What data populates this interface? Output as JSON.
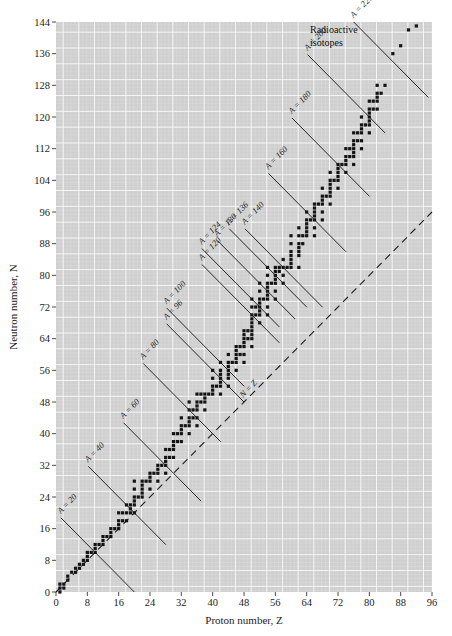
{
  "figure": {
    "background_color": "#ffffff",
    "plot_background_color": "#cfcfcf",
    "grid_minor_color": "#dedede",
    "grid_major_color": "#ffffff",
    "point_color": "#141414",
    "line_color": "#1d1d1d"
  },
  "axes": {
    "x_title": "Proton number, Z",
    "y_title": "Neutron number, N",
    "x_ticks": [
      0,
      8,
      16,
      24,
      32,
      40,
      48,
      56,
      64,
      72,
      80,
      88,
      96
    ],
    "y_ticks": [
      0,
      8,
      16,
      24,
      32,
      40,
      48,
      56,
      64,
      72,
      80,
      88,
      96,
      104,
      112,
      120,
      128,
      136,
      144
    ],
    "xlim": [
      0,
      96
    ],
    "ylim": [
      0,
      144
    ],
    "grid_minor_step": 1,
    "grid_major_step": 4
  },
  "callouts": {
    "radioactive": "Radioactive\nisotopes",
    "radioactive_line1": "Radioactive",
    "radioactive_line2": "isotopes",
    "nz_line": "N = Z"
  },
  "chart_data": {
    "type": "scatter",
    "title": "",
    "xlabel": "Proton number, Z",
    "ylabel": "Neutron number, N",
    "xlim": [
      0,
      96
    ],
    "ylim": [
      0,
      144
    ],
    "grid": true,
    "legend": "none",
    "annotations": [
      {
        "text": "A = 20",
        "A": 20,
        "label_x": 4,
        "label_y": 18
      },
      {
        "text": "A = 40",
        "A": 40,
        "label_x": 11,
        "label_y": 32
      },
      {
        "text": "A = 60",
        "A": 60,
        "label_x": 20,
        "label_y": 42
      },
      {
        "text": "A = 80",
        "A": 80,
        "label_x": 25,
        "label_y": 57
      },
      {
        "text": "A = 96",
        "A": 96,
        "label_x": 31,
        "label_y": 62
      },
      {
        "text": "A = 100",
        "A": 100,
        "label_x": 31,
        "label_y": 68
      },
      {
        "text": "A = 120",
        "A": 120,
        "label_x": 40,
        "label_y": 79
      },
      {
        "text": "A = 124",
        "A": 124,
        "label_x": 40,
        "label_y": 85
      },
      {
        "text": "A = 130",
        "A": 130,
        "label_x": 44,
        "label_y": 88
      },
      {
        "text": "A = 136",
        "A": 136,
        "label_x": 47,
        "label_y": 91
      },
      {
        "text": "A = 140",
        "A": 140,
        "label_x": 51,
        "label_y": 92
      },
      {
        "text": "A = 160",
        "A": 160,
        "label_x": 57,
        "label_y": 104
      },
      {
        "text": "A = 180",
        "A": 180,
        "label_x": 63,
        "label_y": 118
      },
      {
        "text": "A = 200",
        "A": 200,
        "label_x": 67,
        "label_y": 133
      },
      {
        "text": "A = 220",
        "A": 220,
        "label_x": 78,
        "label_y": 140
      }
    ],
    "reference_lines": [
      {
        "name": "N = Z",
        "style": "dashed",
        "from": [
          0,
          0
        ],
        "to": [
          96,
          96
        ]
      }
    ],
    "series": [
      {
        "name": "Stable and long-lived nuclides",
        "marker": "square",
        "points": [
          [
            1,
            0
          ],
          [
            1,
            1
          ],
          [
            1,
            2
          ],
          [
            2,
            1
          ],
          [
            2,
            2
          ],
          [
            3,
            3
          ],
          [
            3,
            4
          ],
          [
            4,
            5
          ],
          [
            5,
            5
          ],
          [
            5,
            6
          ],
          [
            6,
            6
          ],
          [
            6,
            7
          ],
          [
            7,
            7
          ],
          [
            7,
            8
          ],
          [
            8,
            8
          ],
          [
            8,
            9
          ],
          [
            8,
            10
          ],
          [
            9,
            10
          ],
          [
            10,
            10
          ],
          [
            10,
            11
          ],
          [
            10,
            12
          ],
          [
            11,
            12
          ],
          [
            12,
            12
          ],
          [
            12,
            13
          ],
          [
            12,
            14
          ],
          [
            13,
            14
          ],
          [
            14,
            14
          ],
          [
            14,
            15
          ],
          [
            14,
            16
          ],
          [
            15,
            16
          ],
          [
            16,
            16
          ],
          [
            16,
            17
          ],
          [
            16,
            18
          ],
          [
            16,
            20
          ],
          [
            17,
            18
          ],
          [
            17,
            20
          ],
          [
            18,
            18
          ],
          [
            18,
            20
          ],
          [
            18,
            22
          ],
          [
            19,
            20
          ],
          [
            19,
            21
          ],
          [
            19,
            22
          ],
          [
            20,
            20
          ],
          [
            20,
            22
          ],
          [
            20,
            23
          ],
          [
            20,
            24
          ],
          [
            20,
            26
          ],
          [
            20,
            28
          ],
          [
            21,
            24
          ],
          [
            22,
            24
          ],
          [
            22,
            25
          ],
          [
            22,
            26
          ],
          [
            22,
            27
          ],
          [
            22,
            28
          ],
          [
            23,
            28
          ],
          [
            24,
            26
          ],
          [
            24,
            28
          ],
          [
            24,
            29
          ],
          [
            24,
            30
          ],
          [
            25,
            30
          ],
          [
            26,
            28
          ],
          [
            26,
            30
          ],
          [
            26,
            31
          ],
          [
            26,
            32
          ],
          [
            27,
            32
          ],
          [
            28,
            30
          ],
          [
            28,
            32
          ],
          [
            28,
            33
          ],
          [
            28,
            34
          ],
          [
            28,
            36
          ],
          [
            29,
            34
          ],
          [
            29,
            36
          ],
          [
            30,
            34
          ],
          [
            30,
            36
          ],
          [
            30,
            37
          ],
          [
            30,
            38
          ],
          [
            30,
            40
          ],
          [
            31,
            38
          ],
          [
            31,
            40
          ],
          [
            32,
            38
          ],
          [
            32,
            40
          ],
          [
            32,
            41
          ],
          [
            32,
            42
          ],
          [
            32,
            44
          ],
          [
            33,
            42
          ],
          [
            34,
            40
          ],
          [
            34,
            42
          ],
          [
            34,
            43
          ],
          [
            34,
            44
          ],
          [
            34,
            46
          ],
          [
            34,
            48
          ],
          [
            35,
            44
          ],
          [
            35,
            46
          ],
          [
            36,
            42
          ],
          [
            36,
            44
          ],
          [
            36,
            46
          ],
          [
            36,
            47
          ],
          [
            36,
            48
          ],
          [
            36,
            50
          ],
          [
            37,
            48
          ],
          [
            37,
            50
          ],
          [
            38,
            46
          ],
          [
            38,
            48
          ],
          [
            38,
            49
          ],
          [
            38,
            50
          ],
          [
            39,
            50
          ],
          [
            40,
            50
          ],
          [
            40,
            51
          ],
          [
            40,
            52
          ],
          [
            40,
            54
          ],
          [
            40,
            56
          ],
          [
            41,
            52
          ],
          [
            42,
            50
          ],
          [
            42,
            52
          ],
          [
            42,
            53
          ],
          [
            42,
            54
          ],
          [
            42,
            55
          ],
          [
            42,
            56
          ],
          [
            42,
            58
          ],
          [
            44,
            52
          ],
          [
            44,
            54
          ],
          [
            44,
            55
          ],
          [
            44,
            56
          ],
          [
            44,
            57
          ],
          [
            44,
            58
          ],
          [
            44,
            60
          ],
          [
            45,
            58
          ],
          [
            46,
            56
          ],
          [
            46,
            58
          ],
          [
            46,
            59
          ],
          [
            46,
            60
          ],
          [
            46,
            61
          ],
          [
            46,
            62
          ],
          [
            47,
            60
          ],
          [
            47,
            62
          ],
          [
            48,
            58
          ],
          [
            48,
            60
          ],
          [
            48,
            62
          ],
          [
            48,
            63
          ],
          [
            48,
            64
          ],
          [
            48,
            65
          ],
          [
            48,
            66
          ],
          [
            49,
            64
          ],
          [
            49,
            66
          ],
          [
            50,
            62
          ],
          [
            50,
            64
          ],
          [
            50,
            65
          ],
          [
            50,
            66
          ],
          [
            50,
            67
          ],
          [
            50,
            68
          ],
          [
            50,
            69
          ],
          [
            50,
            70
          ],
          [
            50,
            72
          ],
          [
            50,
            74
          ],
          [
            51,
            70
          ],
          [
            51,
            72
          ],
          [
            52,
            68
          ],
          [
            52,
            70
          ],
          [
            52,
            71
          ],
          [
            52,
            72
          ],
          [
            52,
            73
          ],
          [
            52,
            74
          ],
          [
            52,
            76
          ],
          [
            52,
            78
          ],
          [
            53,
            74
          ],
          [
            54,
            70
          ],
          [
            54,
            72
          ],
          [
            54,
            74
          ],
          [
            54,
            75
          ],
          [
            54,
            76
          ],
          [
            54,
            77
          ],
          [
            54,
            78
          ],
          [
            54,
            80
          ],
          [
            54,
            82
          ],
          [
            55,
            78
          ],
          [
            56,
            74
          ],
          [
            56,
            76
          ],
          [
            56,
            78
          ],
          [
            56,
            79
          ],
          [
            56,
            80
          ],
          [
            56,
            81
          ],
          [
            56,
            82
          ],
          [
            57,
            81
          ],
          [
            57,
            82
          ],
          [
            58,
            78
          ],
          [
            58,
            80
          ],
          [
            58,
            82
          ],
          [
            58,
            84
          ],
          [
            59,
            82
          ],
          [
            60,
            82
          ],
          [
            60,
            83
          ],
          [
            60,
            84
          ],
          [
            60,
            85
          ],
          [
            60,
            86
          ],
          [
            60,
            88
          ],
          [
            60,
            90
          ],
          [
            62,
            82
          ],
          [
            62,
            85
          ],
          [
            62,
            86
          ],
          [
            62,
            87
          ],
          [
            62,
            88
          ],
          [
            62,
            90
          ],
          [
            62,
            92
          ],
          [
            63,
            88
          ],
          [
            63,
            90
          ],
          [
            64,
            90
          ],
          [
            64,
            91
          ],
          [
            64,
            92
          ],
          [
            64,
            93
          ],
          [
            64,
            94
          ],
          [
            64,
            96
          ],
          [
            65,
            94
          ],
          [
            66,
            90
          ],
          [
            66,
            92
          ],
          [
            66,
            94
          ],
          [
            66,
            95
          ],
          [
            66,
            96
          ],
          [
            66,
            97
          ],
          [
            66,
            98
          ],
          [
            67,
            98
          ],
          [
            68,
            94
          ],
          [
            68,
            96
          ],
          [
            68,
            98
          ],
          [
            68,
            99
          ],
          [
            68,
            100
          ],
          [
            68,
            102
          ],
          [
            69,
            100
          ],
          [
            70,
            98
          ],
          [
            70,
            100
          ],
          [
            70,
            101
          ],
          [
            70,
            102
          ],
          [
            70,
            103
          ],
          [
            70,
            104
          ],
          [
            70,
            106
          ],
          [
            71,
            104
          ],
          [
            72,
            102
          ],
          [
            72,
            104
          ],
          [
            72,
            105
          ],
          [
            72,
            106
          ],
          [
            72,
            107
          ],
          [
            72,
            108
          ],
          [
            73,
            108
          ],
          [
            74,
            106
          ],
          [
            74,
            108
          ],
          [
            74,
            109
          ],
          [
            74,
            110
          ],
          [
            74,
            112
          ],
          [
            75,
            110
          ],
          [
            75,
            112
          ],
          [
            76,
            108
          ],
          [
            76,
            110
          ],
          [
            76,
            111
          ],
          [
            76,
            112
          ],
          [
            76,
            113
          ],
          [
            76,
            114
          ],
          [
            76,
            116
          ],
          [
            77,
            114
          ],
          [
            77,
            116
          ],
          [
            78,
            112
          ],
          [
            78,
            114
          ],
          [
            78,
            116
          ],
          [
            78,
            117
          ],
          [
            78,
            118
          ],
          [
            78,
            120
          ],
          [
            79,
            118
          ],
          [
            80,
            116
          ],
          [
            80,
            118
          ],
          [
            80,
            119
          ],
          [
            80,
            120
          ],
          [
            80,
            121
          ],
          [
            80,
            122
          ],
          [
            80,
            124
          ],
          [
            81,
            122
          ],
          [
            81,
            124
          ],
          [
            82,
            122
          ],
          [
            82,
            124
          ],
          [
            82,
            125
          ],
          [
            82,
            126
          ],
          [
            82,
            128
          ],
          [
            83,
            126
          ],
          [
            84,
            128
          ],
          [
            86,
            136
          ],
          [
            88,
            138
          ],
          [
            90,
            142
          ],
          [
            92,
            143
          ]
        ]
      }
    ]
  }
}
